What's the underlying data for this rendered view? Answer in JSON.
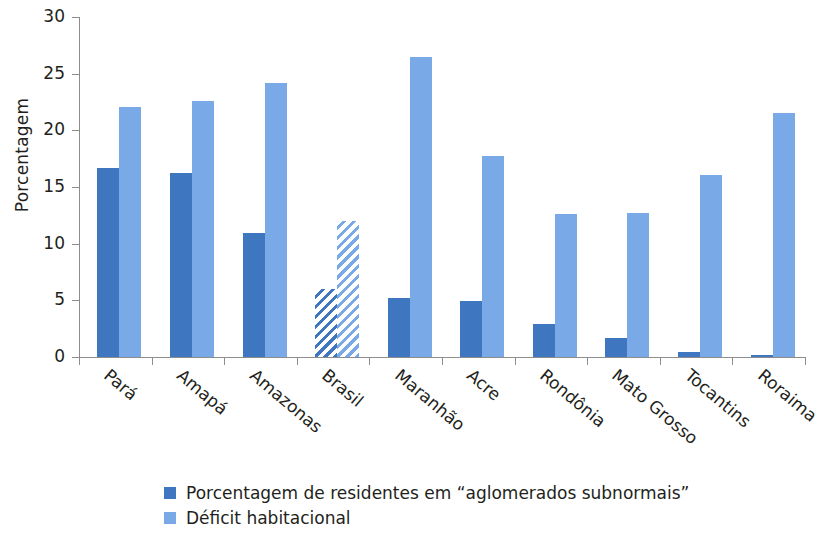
{
  "chart_data": {
    "type": "bar",
    "title": "",
    "xlabel": "",
    "ylabel": "Porcentagem",
    "ylim": [
      0,
      30
    ],
    "yticks": [
      0,
      5,
      10,
      15,
      20,
      25,
      30
    ],
    "grid": false,
    "legend_position": "bottom-left",
    "categories": [
      "Pará",
      "Amapá",
      "Amazonas",
      "Brasil",
      "Maranhão",
      "Acre",
      "Rondônia",
      "Mato Grosso",
      "Tocantins",
      "Roraima"
    ],
    "highlighted_category": "Brasil",
    "highlight_style": "hatched",
    "series": [
      {
        "name": "Porcentagem de residentes em “aglomerados subnormais”",
        "color": "#3f76c0",
        "values": [
          16.7,
          16.2,
          10.9,
          6.0,
          5.2,
          4.9,
          2.9,
          1.7,
          0.4,
          0.15
        ]
      },
      {
        "name": "Déficit habitacional",
        "color": "#7aa9e8",
        "values": [
          22.1,
          22.6,
          24.2,
          12.0,
          26.5,
          17.7,
          12.6,
          12.7,
          16.1,
          21.5
        ]
      }
    ]
  },
  "axis": {
    "y_title": "Porcentagem",
    "y_tick_labels": [
      "0",
      "5",
      "10",
      "15",
      "20",
      "25",
      "30"
    ]
  },
  "legend": {
    "items": [
      {
        "label": "Porcentagem de residentes em “aglomerados subnormais”",
        "color": "#3f76c0"
      },
      {
        "label": "Déficit habitacional",
        "color": "#7aa9e8"
      }
    ]
  }
}
